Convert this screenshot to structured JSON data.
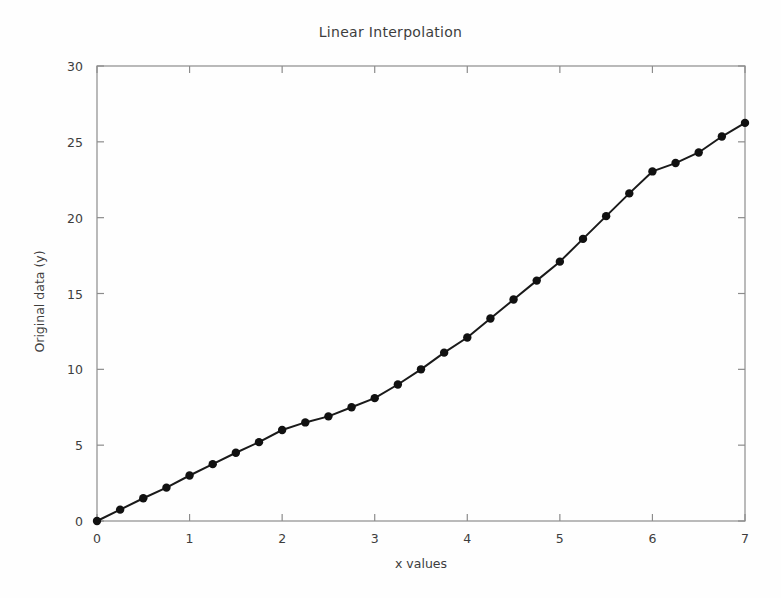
{
  "chart_data": {
    "type": "line",
    "title": "Linear Interpolation",
    "xlabel": "x values",
    "ylabel": "Original data (y)",
    "xlim": [
      0,
      7
    ],
    "ylim": [
      0,
      30
    ],
    "xticks": [
      0,
      1,
      2,
      3,
      4,
      5,
      6,
      7
    ],
    "yticks": [
      0,
      5,
      10,
      15,
      20,
      25,
      30
    ],
    "grid": false,
    "legend": null,
    "marker": "filled-circle",
    "line_color": "#1a1a1a",
    "marker_color": "#111111",
    "x": [
      0,
      0.25,
      0.5,
      0.75,
      1.0,
      1.25,
      1.5,
      1.75,
      2.0,
      2.25,
      2.5,
      2.75,
      3.0,
      3.25,
      3.5,
      3.75,
      4.0,
      4.25,
      4.5,
      4.75,
      5.0,
      5.25,
      5.5,
      5.75,
      6.0,
      6.25,
      6.5,
      6.75,
      7.0
    ],
    "values": [
      0.0,
      0.75,
      1.5,
      2.2,
      3.0,
      3.75,
      4.5,
      5.2,
      6.0,
      6.5,
      6.9,
      7.5,
      8.1,
      9.0,
      10.0,
      11.1,
      12.1,
      13.35,
      14.6,
      15.85,
      17.1,
      18.6,
      20.1,
      21.6,
      23.05,
      23.6,
      24.3,
      25.35,
      26.25
    ],
    "series": [
      {
        "name": "Original data",
        "values": [
          0.0,
          0.75,
          1.5,
          2.2,
          3.0,
          3.75,
          4.5,
          5.2,
          6.0,
          6.5,
          6.9,
          7.5,
          8.1,
          9.0,
          10.0,
          11.1,
          12.1,
          13.35,
          14.6,
          15.85,
          17.1,
          18.6,
          20.1,
          21.6,
          23.05,
          23.6,
          24.3,
          25.35,
          26.25
        ]
      }
    ]
  },
  "axes": {
    "ytick_labels": [
      "0",
      "5",
      "10",
      "15",
      "20",
      "25",
      "30"
    ],
    "xtick_labels": [
      "0",
      "1",
      "2",
      "3",
      "4",
      "5",
      "6",
      "7"
    ]
  }
}
